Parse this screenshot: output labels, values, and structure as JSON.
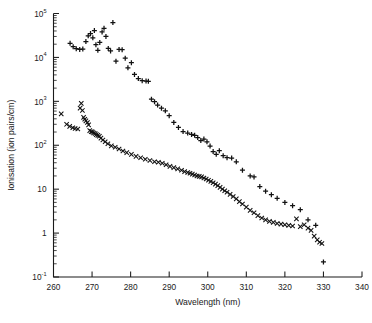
{
  "chart_data": {
    "type": "scatter",
    "title": "",
    "xlabel": "Wavelength (nm)",
    "ylabel": "Ionisation (ion pairs/cm)",
    "xlim": [
      260,
      340
    ],
    "ylim": [
      0.1,
      100000
    ],
    "yscale": "log",
    "xscale": "linear",
    "grid": false,
    "legend": "none",
    "xticks": [
      260,
      270,
      280,
      290,
      300,
      310,
      320,
      330,
      340
    ],
    "xtick_labels": [
      "260",
      "270",
      "280",
      "290",
      "300",
      "310",
      "320",
      "330",
      "340"
    ],
    "yticks": [
      0.1,
      1,
      10,
      100,
      1000,
      10000,
      100000
    ],
    "ytick_labels": [
      "10-1",
      "1",
      "10",
      "102",
      "103",
      "104",
      "105"
    ],
    "ytick_mantissa": [
      "10",
      "1",
      "10",
      "10",
      "10",
      "10",
      "10"
    ],
    "ytick_exponent": [
      "-1",
      "",
      "",
      "2",
      "3",
      "4",
      "5"
    ],
    "series": [
      {
        "name": "upper-branch",
        "marker": "plus",
        "points": [
          [
            264.3,
            21000
          ],
          [
            265.1,
            17500
          ],
          [
            265.9,
            15800
          ],
          [
            266.8,
            15200
          ],
          [
            267.6,
            15500
          ],
          [
            268.4,
            23000
          ],
          [
            269.0,
            31000
          ],
          [
            269.6,
            35000
          ],
          [
            270.2,
            28000
          ],
          [
            270.6,
            41000
          ],
          [
            271.0,
            19500
          ],
          [
            271.5,
            14500
          ],
          [
            272.0,
            22000
          ],
          [
            272.6,
            38000
          ],
          [
            273.1,
            46000
          ],
          [
            273.6,
            30000
          ],
          [
            274.2,
            16000
          ],
          [
            274.8,
            14000
          ],
          [
            275.4,
            62000
          ],
          [
            276.2,
            8200
          ],
          [
            277.0,
            15200
          ],
          [
            277.8,
            15000
          ],
          [
            278.6,
            9600
          ],
          [
            279.3,
            5800
          ],
          [
            280.2,
            7600
          ],
          [
            281.0,
            4100
          ],
          [
            282.0,
            3300
          ],
          [
            283.0,
            2950
          ],
          [
            284.0,
            2900
          ],
          [
            284.6,
            2850
          ],
          [
            285.4,
            1120
          ],
          [
            286.2,
            980
          ],
          [
            287.0,
            820
          ],
          [
            288.0,
            700
          ],
          [
            289.0,
            610
          ],
          [
            290.0,
            470
          ],
          [
            291.2,
            330
          ],
          [
            292.4,
            255
          ],
          [
            293.6,
            205
          ],
          [
            294.8,
            190
          ],
          [
            295.8,
            176
          ],
          [
            296.6,
            168
          ],
          [
            297.4,
            150
          ],
          [
            298.2,
            128
          ],
          [
            299.0,
            138
          ],
          [
            299.8,
            120
          ],
          [
            300.6,
            96
          ],
          [
            301.4,
            72
          ],
          [
            302.2,
            62
          ],
          [
            303.0,
            75
          ],
          [
            304.0,
            58
          ],
          [
            305.0,
            52
          ],
          [
            306.2,
            51
          ],
          [
            307.4,
            42
          ],
          [
            309.0,
            27
          ],
          [
            311.0,
            20
          ],
          [
            312.0,
            19
          ],
          [
            313.5,
            11.5
          ],
          [
            315.0,
            9.0
          ],
          [
            316.5,
            7.5
          ],
          [
            318.0,
            6.2
          ],
          [
            320.0,
            5.0
          ],
          [
            322.0,
            4.2
          ],
          [
            324.0,
            3.4
          ],
          [
            326.0,
            2.0
          ],
          [
            328.0,
            1.5
          ],
          [
            330.0,
            0.22
          ]
        ]
      },
      {
        "name": "lower-branch",
        "marker": "cross",
        "points": [
          [
            262.0,
            520
          ],
          [
            263.4,
            300
          ],
          [
            264.2,
            270
          ],
          [
            265.0,
            250
          ],
          [
            265.6,
            240
          ],
          [
            266.3,
            235
          ],
          [
            266.9,
            700
          ],
          [
            267.2,
            900
          ],
          [
            267.5,
            620
          ],
          [
            267.8,
            430
          ],
          [
            268.1,
            390
          ],
          [
            268.4,
            360
          ],
          [
            268.8,
            330
          ],
          [
            269.1,
            290
          ],
          [
            269.4,
            215
          ],
          [
            269.8,
            205
          ],
          [
            270.1,
            200
          ],
          [
            270.4,
            190
          ],
          [
            270.8,
            185
          ],
          [
            271.1,
            175
          ],
          [
            271.5,
            168
          ],
          [
            271.9,
            160
          ],
          [
            272.3,
            145
          ],
          [
            272.8,
            132
          ],
          [
            273.4,
            120
          ],
          [
            274.1,
            108
          ],
          [
            275.0,
            97
          ],
          [
            276.0,
            90
          ],
          [
            277.0,
            82
          ],
          [
            278.0,
            74
          ],
          [
            279.0,
            68
          ],
          [
            280.2,
            62
          ],
          [
            281.4,
            56
          ],
          [
            282.6,
            52
          ],
          [
            283.8,
            48
          ],
          [
            285.0,
            45
          ],
          [
            286.2,
            42
          ],
          [
            287.2,
            41
          ],
          [
            288.2,
            39
          ],
          [
            289.2,
            36
          ],
          [
            290.2,
            33
          ],
          [
            291.2,
            31
          ],
          [
            292.2,
            29
          ],
          [
            293.2,
            27
          ],
          [
            294.0,
            25
          ],
          [
            294.8,
            24
          ],
          [
            295.4,
            23
          ],
          [
            296.0,
            22
          ],
          [
            296.6,
            21
          ],
          [
            297.2,
            20
          ],
          [
            297.8,
            19.5
          ],
          [
            298.4,
            19
          ],
          [
            299.0,
            18
          ],
          [
            299.6,
            17
          ],
          [
            300.2,
            16
          ],
          [
            300.8,
            15
          ],
          [
            301.4,
            14
          ],
          [
            302.0,
            13
          ],
          [
            302.6,
            12
          ],
          [
            303.2,
            11
          ],
          [
            303.8,
            10
          ],
          [
            304.4,
            9.2
          ],
          [
            305.0,
            8.5
          ],
          [
            305.8,
            7.6
          ],
          [
            306.6,
            6.8
          ],
          [
            307.4,
            6.0
          ],
          [
            308.2,
            5.2
          ],
          [
            309.0,
            4.6
          ],
          [
            310.0,
            3.9
          ],
          [
            311.0,
            3.3
          ],
          [
            312.0,
            2.9
          ],
          [
            313.0,
            2.5
          ],
          [
            314.0,
            2.2
          ],
          [
            315.0,
            2.0
          ],
          [
            316.0,
            1.85
          ],
          [
            317.0,
            1.75
          ],
          [
            318.0,
            1.65
          ],
          [
            319.0,
            1.6
          ],
          [
            320.0,
            1.55
          ],
          [
            321.0,
            1.5
          ],
          [
            322.0,
            1.45
          ],
          [
            323.0,
            2.1
          ],
          [
            324.0,
            1.4
          ],
          [
            325.0,
            1.55
          ],
          [
            326.0,
            1.3
          ],
          [
            326.8,
            1.15
          ],
          [
            327.6,
            0.85
          ],
          [
            328.4,
            0.7
          ],
          [
            329.0,
            0.62
          ],
          [
            329.6,
            0.58
          ]
        ]
      }
    ]
  }
}
